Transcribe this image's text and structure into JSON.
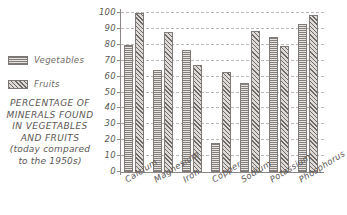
{
  "chart_data": {
    "type": "bar",
    "title": "PERCENTAGE OF MINERALS FOUND IN VEGETABLES AND FRUITS (today compared to the 1950s)",
    "xlabel": "",
    "ylabel": "",
    "ylim": [
      0,
      100
    ],
    "yticks": [
      0,
      10,
      20,
      30,
      40,
      50,
      60,
      70,
      80,
      90,
      100
    ],
    "grid": true,
    "legend_position": "left",
    "categories": [
      "Calcium",
      "Magnesium",
      "Iron",
      "Copper",
      "Sodium",
      "Potassium",
      "Phosphorus"
    ],
    "series": [
      {
        "name": "Vegetables",
        "values": [
          80,
          64,
          77,
          18,
          56,
          85,
          93
        ]
      },
      {
        "name": "Fruits",
        "values": [
          100,
          88,
          67,
          63,
          89,
          79,
          99
        ]
      }
    ]
  },
  "title": {
    "line1": "PERCENTAGE OF",
    "line2": "MINERALS FOUND",
    "line3": "IN VEGETABLES",
    "line4": "AND FRUITS",
    "line5": "(today compared",
    "line6": "to the 1950s)"
  },
  "legend": {
    "items": [
      {
        "label": "Vegetables",
        "pattern": "horizontal-hatch",
        "color": "#cbc7c4"
      },
      {
        "label": "Fruits",
        "pattern": "diagonal-hatch",
        "color": "#b5b1ae"
      }
    ]
  },
  "axis": {
    "y_ticks": [
      "100",
      "90",
      "80",
      "70",
      "60",
      "50",
      "40",
      "30",
      "20",
      "10",
      "0"
    ],
    "x_ticks": [
      "Calcium",
      "Magnesium",
      "Iron",
      "Copper",
      "Sodium",
      "Potassium",
      "Phosphorus"
    ]
  },
  "colors": {
    "text": "#5c5754",
    "axis": "#8d8885",
    "grid": "#bdb9b6",
    "background": "#ffffff"
  }
}
